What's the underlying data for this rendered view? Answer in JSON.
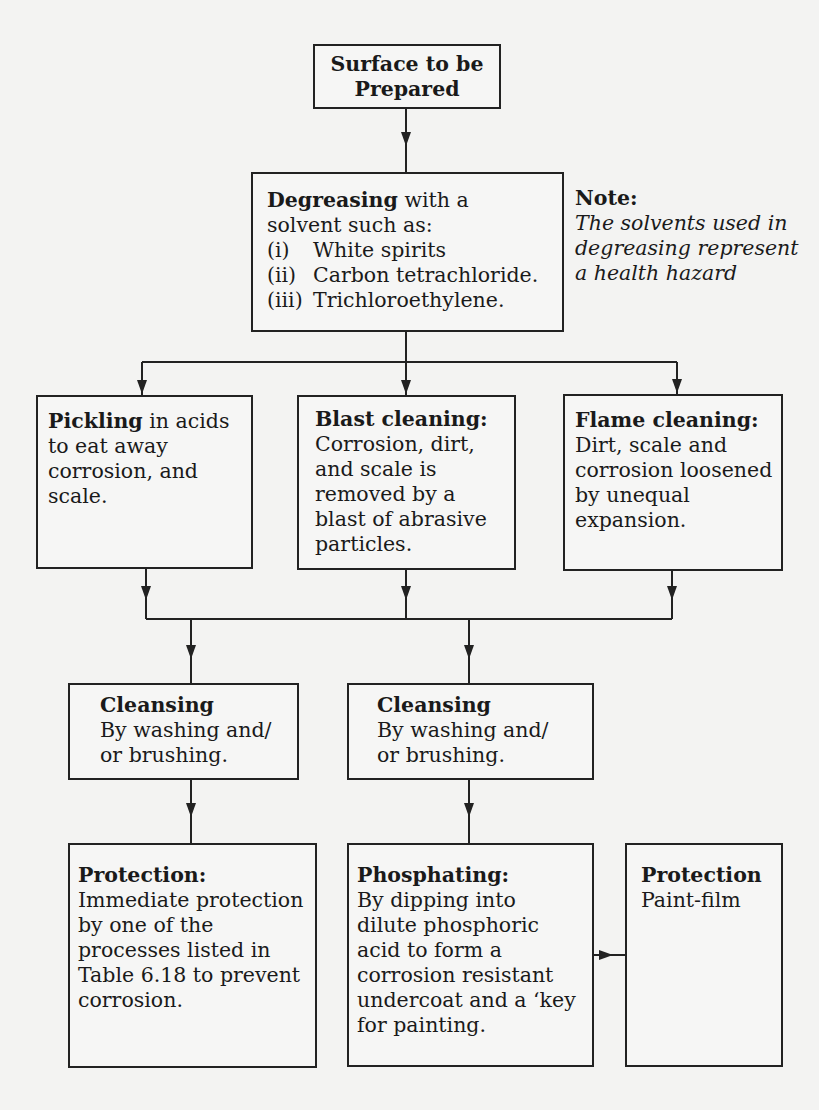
{
  "diagram": {
    "surface": {
      "line1": "Surface to be",
      "line2": "Prepared"
    },
    "degreasing": {
      "title": "Degreasing",
      "title_suffix": " with a",
      "line2": "solvent such as:",
      "items": [
        {
          "num": "(i)",
          "text": "White spirits"
        },
        {
          "num": "(ii)",
          "text": "Carbon tetrachloride."
        },
        {
          "num": "(iii)",
          "text": "Trichloroethylene."
        }
      ]
    },
    "note": {
      "title": "Note:",
      "lines": [
        "The solvents used in",
        "degreasing represent",
        "a health hazard"
      ]
    },
    "pickling": {
      "title": "Pickling",
      "title_suffix": " in acids",
      "lines": [
        "to eat away",
        "corrosion, and",
        "scale."
      ]
    },
    "blast": {
      "title": "Blast cleaning:",
      "lines": [
        "Corrosion, dirt,",
        "and scale is",
        "removed by a",
        "blast of abrasive",
        "particles."
      ]
    },
    "flame": {
      "title": "Flame cleaning:",
      "lines": [
        "Dirt, scale and",
        "corrosion loosened",
        "by unequal",
        "expansion."
      ]
    },
    "cleansing_left": {
      "title": "Cleansing",
      "lines": [
        "By washing and/",
        "or brushing."
      ]
    },
    "cleansing_right": {
      "title": "Cleansing",
      "lines": [
        "By washing and/",
        "or brushing."
      ]
    },
    "protection_left": {
      "title": "Protection:",
      "lines": [
        "Immediate protection",
        "by one of the",
        "processes listed in",
        "Table 6.18 to prevent",
        "corrosion."
      ]
    },
    "phosphating": {
      "title": "Phosphating:",
      "lines": [
        "By dipping into",
        "dilute phosphoric",
        "acid to form a",
        "corrosion resistant",
        "undercoat and a ‘key",
        "for painting."
      ]
    },
    "protection_right": {
      "title": "Protection",
      "lines": [
        "Paint-film"
      ]
    }
  },
  "colors": {
    "background": "#f3f3f2",
    "line": "#222222",
    "text": "#1a1a1a"
  }
}
